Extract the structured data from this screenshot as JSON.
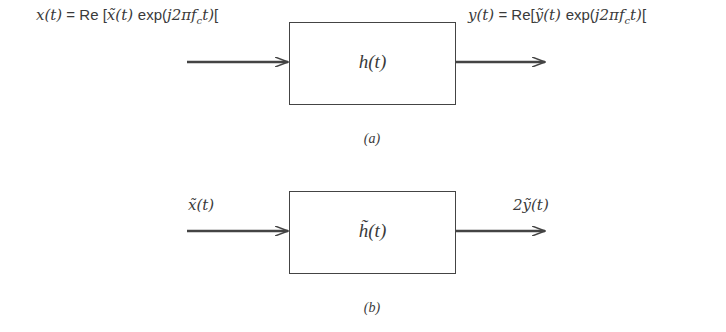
{
  "diagram_a": {
    "input_label": "x(t) = Re [x̃(t) exp(j2πf_c t)]",
    "input_label_parts": {
      "lhs": "x(t)",
      "eq": " = ",
      "re": "Re [",
      "x": "x̃(t) ",
      "exp": "exp(",
      "arg": "j2πf",
      "sub": "c",
      "t": "t)",
      "close": "["
    },
    "block": "h(t)",
    "output_label": "y(t) = Re[ỹ(t) exp(j2πf_c t)]",
    "output_label_parts": {
      "lhs": "y(t)",
      "eq": " = ",
      "re": "Re[",
      "y": "ỹ(t) ",
      "exp": "exp(",
      "arg": "j2πf",
      "sub": "c",
      "t": "t)",
      "close": "["
    },
    "caption": "(a)"
  },
  "diagram_b": {
    "input_label": "x̃(t)",
    "block": "h̃(t)",
    "output_label": "2ỹ(t)",
    "caption": "(b)"
  },
  "colors": {
    "line": "#444444",
    "text": "#3a3a3a"
  }
}
